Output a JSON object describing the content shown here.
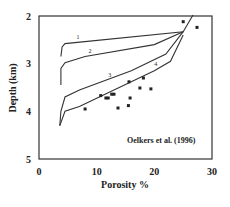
{
  "chart_data": {
    "type": "scatter",
    "title": "",
    "xlabel": "Porosity %",
    "ylabel": "Depth (km)",
    "xlim": [
      0,
      30
    ],
    "ylim": [
      5,
      2
    ],
    "y_inverted": true,
    "grid": false,
    "x_ticks": [
      0,
      10,
      20,
      30
    ],
    "y_ticks": [
      2,
      3,
      4,
      5
    ],
    "annotation": "Oelkers et al. (1996)",
    "series": [
      {
        "name": "Observed data",
        "kind": "scatter",
        "points": [
          {
            "x": 8.0,
            "y": 3.95
          },
          {
            "x": 10.7,
            "y": 3.67
          },
          {
            "x": 11.6,
            "y": 3.72
          },
          {
            "x": 12.0,
            "y": 3.72
          },
          {
            "x": 12.6,
            "y": 3.64
          },
          {
            "x": 13.0,
            "y": 3.64
          },
          {
            "x": 13.7,
            "y": 3.93
          },
          {
            "x": 15.5,
            "y": 3.88
          },
          {
            "x": 15.6,
            "y": 3.38
          },
          {
            "x": 15.8,
            "y": 3.72
          },
          {
            "x": 17.5,
            "y": 3.51
          },
          {
            "x": 18.1,
            "y": 3.3
          },
          {
            "x": 19.4,
            "y": 3.53
          },
          {
            "x": 25.0,
            "y": 2.12
          },
          {
            "x": 27.4,
            "y": 2.24
          }
        ]
      },
      {
        "name": "1",
        "kind": "line",
        "points": [
          {
            "x": 26.7,
            "y": 1.98
          },
          {
            "x": 25.0,
            "y": 2.33
          },
          {
            "x": 4.5,
            "y": 2.58
          },
          {
            "x": 4.0,
            "y": 2.65
          },
          {
            "x": 3.8,
            "y": 2.85
          }
        ]
      },
      {
        "name": "2",
        "kind": "line",
        "points": [
          {
            "x": 25.0,
            "y": 2.33
          },
          {
            "x": 20.0,
            "y": 2.6
          },
          {
            "x": 8.0,
            "y": 2.85
          },
          {
            "x": 4.5,
            "y": 2.98
          },
          {
            "x": 3.8,
            "y": 3.1
          },
          {
            "x": 3.8,
            "y": 3.45
          }
        ]
      },
      {
        "name": "3",
        "kind": "line",
        "points": [
          {
            "x": 25.0,
            "y": 2.33
          },
          {
            "x": 22.0,
            "y": 2.8
          },
          {
            "x": 16.0,
            "y": 3.15
          },
          {
            "x": 7.0,
            "y": 3.55
          },
          {
            "x": 4.5,
            "y": 3.7
          },
          {
            "x": 3.8,
            "y": 4.0
          },
          {
            "x": 3.6,
            "y": 4.3
          }
        ]
      },
      {
        "name": "4",
        "kind": "line",
        "points": [
          {
            "x": 25.0,
            "y": 2.4
          },
          {
            "x": 22.8,
            "y": 2.95
          },
          {
            "x": 20.0,
            "y": 3.15
          },
          {
            "x": 7.0,
            "y": 3.9
          },
          {
            "x": 4.5,
            "y": 4.0
          },
          {
            "x": 3.6,
            "y": 4.3
          }
        ]
      }
    ],
    "curve_labels": [
      {
        "text": "1",
        "x": 6.5,
        "y": 2.48
      },
      {
        "text": "2",
        "x": 8.6,
        "y": 2.78
      },
      {
        "text": "3",
        "x": 12.0,
        "y": 3.27
      },
      {
        "text": "4",
        "x": 20.0,
        "y": 3.05
      }
    ]
  }
}
